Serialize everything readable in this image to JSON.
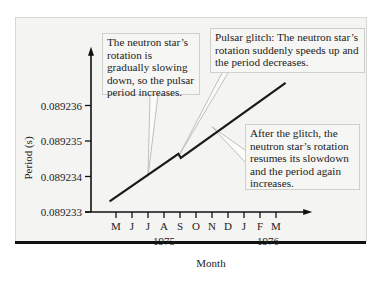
{
  "chart_data": {
    "type": "line",
    "title": "",
    "xlabel": "Month",
    "ylabel": "Period (s)",
    "x_ticks": [
      "M",
      "J",
      "J",
      "A",
      "S",
      "O",
      "N",
      "D",
      "J",
      "F",
      "M"
    ],
    "x_year_labels": [
      {
        "label": "1975",
        "month_index": 3
      },
      {
        "label": "1976",
        "month_index": 9.5
      }
    ],
    "y_ticks": [
      "0.089233",
      "0.089234",
      "0.089235",
      "0.089236"
    ],
    "y_tick_values": [
      0.089233,
      0.089234,
      0.089235,
      0.089236
    ],
    "ylim": [
      0.089233,
      0.0892376
    ],
    "xlim": [
      -1.3,
      12.2
    ],
    "x_unit": "months since May 1975",
    "grid": false,
    "series": [
      {
        "name": "Pulsar period",
        "x": [
          -0.4,
          3.9,
          4.05,
          10.6
        ],
        "y": [
          0.0892333,
          0.08923464,
          0.08923452,
          0.08923664
        ]
      }
    ],
    "annotations": [
      {
        "name": "slowdown",
        "text": "The neutron star’s rotation is gradually slowing down, so the pulsar period increases.",
        "points_to": {
          "x": 2.0,
          "y": 0.089234
        }
      },
      {
        "name": "glitch",
        "text": "Pulsar glitch: The neutron star’s rotation suddenly speeds up and the period decreases.",
        "points_to": {
          "x": 3.95,
          "y": 0.0892346
        }
      },
      {
        "name": "resume",
        "text": "After the glitch, the neutron star’s rotation resumes its slowdown and the period again increases.",
        "points_to": {
          "x": 6.0,
          "y": 0.0892354
        }
      }
    ]
  },
  "callouts": {
    "slowdown": "The neutron star’s rotation is gradually slowing down, so the pulsar period increases.",
    "glitch": "Pulsar glitch: The neutron star’s rotation suddenly speeds up and the period decreases.",
    "resume": "After the glitch, the neutron star’s rotation resumes its slowdown and the period again increases."
  },
  "colors": {
    "line": "#1a1a1a",
    "panel": "#f4f4f2",
    "callout_border": "#cfcfcc",
    "leader": "#b8b8b4"
  }
}
